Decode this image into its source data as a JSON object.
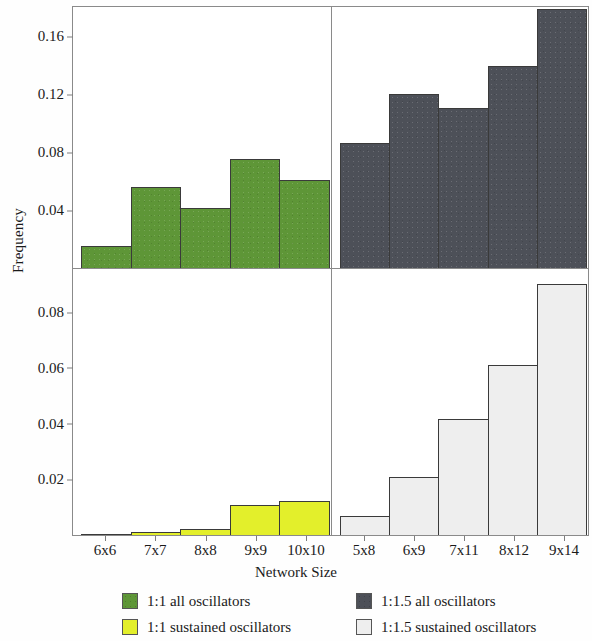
{
  "chart_data": {
    "type": "bar",
    "title": "",
    "xlabel": "Network Size",
    "ylabel": "Frequency",
    "grid": false,
    "legend_position": "bottom",
    "panels": [
      {
        "id": "top-left",
        "series_name": "1:1 all oscillators",
        "color": "#5e9637",
        "categories": [
          "6x6",
          "7x7",
          "8x8",
          "9x9",
          "10x10"
        ],
        "values": [
          0.0153,
          0.0557,
          0.0411,
          0.0751,
          0.0605
        ],
        "ylim": [
          0,
          0.18
        ],
        "yticks": [
          0.04,
          0.08,
          0.12,
          0.16
        ],
        "ytick_labels": [
          "0.04",
          "0.08",
          "0.12",
          "0.16"
        ]
      },
      {
        "id": "top-right",
        "series_name": "1:1.5 all oscillators",
        "color": "#4d5058",
        "categories": [
          "5x8",
          "6x9",
          "7x11",
          "8x12",
          "9x14"
        ],
        "values": [
          0.0863,
          0.1197,
          0.1106,
          0.1391,
          0.1788
        ],
        "ylim": [
          0,
          0.18
        ],
        "yticks": [
          0.04,
          0.08,
          0.12,
          0.16
        ],
        "ytick_labels": [
          "0.04",
          "0.08",
          "0.12",
          "0.16"
        ]
      },
      {
        "id": "bottom-left",
        "series_name": "1:1 sustained oscillators",
        "color": "#e3ef2b",
        "categories": [
          "6x6",
          "7x7",
          "8x8",
          "9x9",
          "10x10"
        ],
        "values": [
          0.0002,
          0.0011,
          0.0022,
          0.0108,
          0.0123
        ],
        "ylim": [
          0,
          0.0955
        ],
        "yticks": [
          0.02,
          0.04,
          0.06,
          0.08
        ],
        "ytick_labels": [
          "0.02",
          "0.04",
          "0.06",
          "0.08"
        ]
      },
      {
        "id": "bottom-right",
        "series_name": "1:1.5 sustained oscillators",
        "color": "#eeeeee",
        "categories": [
          "5x8",
          "6x9",
          "7x11",
          "8x12",
          "9x14"
        ],
        "values": [
          0.0068,
          0.0209,
          0.0418,
          0.0609,
          0.0901
        ],
        "ylim": [
          0,
          0.0955
        ],
        "yticks": [
          0.02,
          0.04,
          0.06,
          0.08
        ],
        "ytick_labels": [
          "0.02",
          "0.04",
          "0.06",
          "0.08"
        ]
      }
    ],
    "legend": [
      {
        "label": "1:1 all oscillators",
        "color": "#5e9637",
        "swatch": "green"
      },
      {
        "label": "1:1.5 all oscillators",
        "color": "#4d5058",
        "swatch": "darkgray"
      },
      {
        "label": "1:1 sustained oscillators",
        "color": "#e3ef2b",
        "swatch": "yellow"
      },
      {
        "label": "1:1.5 sustained oscillators",
        "color": "#eeeeee",
        "swatch": "lightgray"
      }
    ]
  },
  "axes": {
    "ylabel": "Frequency",
    "xlabel": "Network Size",
    "top_yticks": [
      "0.16",
      "0.12",
      "0.08",
      "0.04"
    ],
    "bottom_yticks": [
      "0.08",
      "0.06",
      "0.04",
      "0.02"
    ],
    "xticks_left": [
      "6x6",
      "7x7",
      "8x8",
      "9x9",
      "10x10"
    ],
    "xticks_right": [
      "5x8",
      "6x9",
      "7x11",
      "8x12",
      "9x14"
    ]
  },
  "legend_labels": {
    "green": "1:1 all oscillators",
    "darkgray": "1:1.5 all oscillators",
    "yellow": "1:1 sustained oscillators",
    "lightgray": "1:1.5 sustained oscillators"
  }
}
